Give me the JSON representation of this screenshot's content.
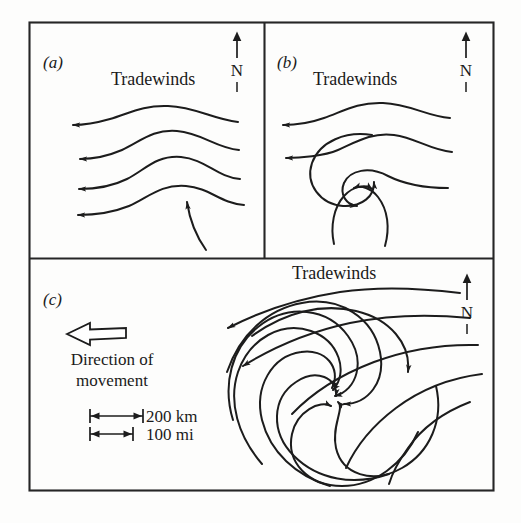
{
  "figure": {
    "background_color": "#fdfdfc",
    "ink_color": "#1c1c1c",
    "width": 521,
    "height": 523
  },
  "panels": [
    {
      "id": "a",
      "label": "(a)",
      "stage": "easterly wave in the tradewinds",
      "tradewinds_label": "Tradewinds",
      "north_label": "N",
      "streamline_count": 4,
      "flow_direction": "westward",
      "has_closed_circulation": false
    },
    {
      "id": "b",
      "label": "(b)",
      "stage": "tropical depression with closed circulation",
      "tradewinds_label": "Tradewinds",
      "north_label": "N",
      "streamline_count": 2,
      "flow_direction": "westward",
      "has_closed_circulation": true,
      "rotation": "counterclockwise"
    },
    {
      "id": "c",
      "label": "(c)",
      "stage": "mature hurricane with spiral bands",
      "tradewinds_label": "Tradewinds",
      "north_label": "N",
      "spiral_arm_count": 9,
      "rotation": "counterclockwise",
      "direction_label_line1": "Direction of",
      "direction_label_line2": "movement",
      "direction_arrow": "west-pointing-hollow-arrow",
      "scale": {
        "km_label": "200 km",
        "mi_label": "100 mi"
      }
    }
  ]
}
